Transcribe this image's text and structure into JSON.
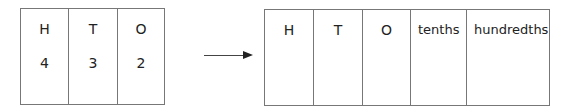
{
  "left_table": {
    "columns": [
      {
        "header": "H",
        "value": "4"
      },
      {
        "header": "T",
        "value": "3"
      },
      {
        "header": "O",
        "value": "2"
      }
    ]
  },
  "arrow": {
    "direction": "right",
    "icon": "arrow-right-icon"
  },
  "right_table": {
    "columns": [
      {
        "header": "H",
        "value": ""
      },
      {
        "header": "T",
        "value": ""
      },
      {
        "header": "O",
        "value": ""
      },
      {
        "header": "tenths",
        "value": ""
      },
      {
        "header": "hundredths",
        "value": ""
      }
    ]
  },
  "colors": {
    "border": "#777777",
    "text": "#222222",
    "background": "#ffffff"
  }
}
